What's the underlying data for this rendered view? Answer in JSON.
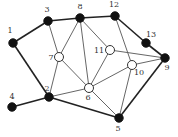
{
  "diagram": {
    "type": "graph",
    "nodes": [
      {
        "id": "1",
        "label": "1",
        "style": "filled"
      },
      {
        "id": "2",
        "label": "2",
        "style": "filled"
      },
      {
        "id": "3",
        "label": "3",
        "style": "filled"
      },
      {
        "id": "4",
        "label": "4",
        "style": "filled"
      },
      {
        "id": "5",
        "label": "5",
        "style": "filled"
      },
      {
        "id": "6",
        "label": "6",
        "style": "hollow"
      },
      {
        "id": "7",
        "label": "7",
        "style": "hollow"
      },
      {
        "id": "8",
        "label": "8",
        "style": "filled"
      },
      {
        "id": "9",
        "label": "9",
        "style": "filled"
      },
      {
        "id": "10",
        "label": "10",
        "style": "hollow"
      },
      {
        "id": "11",
        "label": "11",
        "style": "hollow"
      },
      {
        "id": "12",
        "label": "12",
        "style": "filled"
      },
      {
        "id": "13",
        "label": "13",
        "style": "filled"
      }
    ],
    "edges": [
      {
        "from": "1",
        "to": "3",
        "weight": "thick"
      },
      {
        "from": "3",
        "to": "8",
        "weight": "thick"
      },
      {
        "from": "8",
        "to": "12",
        "weight": "thick"
      },
      {
        "from": "12",
        "to": "13",
        "weight": "thick"
      },
      {
        "from": "13",
        "to": "9",
        "weight": "thick"
      },
      {
        "from": "1",
        "to": "2",
        "weight": "thick"
      },
      {
        "from": "4",
        "to": "2",
        "weight": "thick"
      },
      {
        "from": "2",
        "to": "5",
        "weight": "thick"
      },
      {
        "from": "5",
        "to": "9",
        "weight": "thick"
      },
      {
        "from": "3",
        "to": "7",
        "weight": "thin"
      },
      {
        "from": "7",
        "to": "8",
        "weight": "thin"
      },
      {
        "from": "7",
        "to": "2",
        "weight": "thin"
      },
      {
        "from": "7",
        "to": "6",
        "weight": "thin"
      },
      {
        "from": "8",
        "to": "6",
        "weight": "thin"
      },
      {
        "from": "8",
        "to": "11",
        "weight": "thin"
      },
      {
        "from": "11",
        "to": "6",
        "weight": "thin"
      },
      {
        "from": "11",
        "to": "9",
        "weight": "thin"
      },
      {
        "from": "12",
        "to": "10",
        "weight": "thin"
      },
      {
        "from": "10",
        "to": "6",
        "weight": "thin"
      },
      {
        "from": "10",
        "to": "5",
        "weight": "thin"
      },
      {
        "from": "10",
        "to": "9",
        "weight": "thin"
      },
      {
        "from": "2",
        "to": "6",
        "weight": "thin"
      },
      {
        "from": "6",
        "to": "5",
        "weight": "thin"
      }
    ]
  }
}
